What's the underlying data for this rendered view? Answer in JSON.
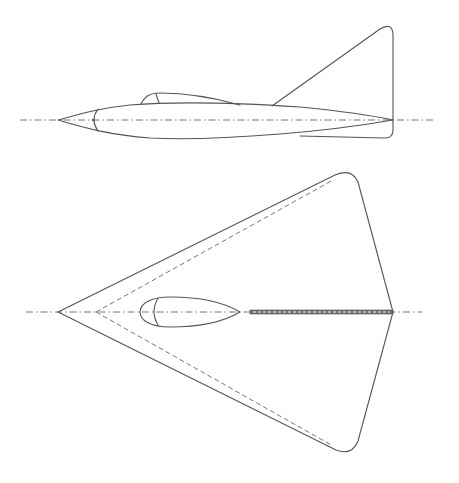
{
  "figure": {
    "type": "aircraft-two-view-drawing",
    "views": [
      {
        "name": "side-view",
        "parts": [
          "fuselage",
          "canopy",
          "vertical-fin",
          "centerline"
        ]
      },
      {
        "name": "plan-view",
        "parts": [
          "delta-wing",
          "hidden-spar-lines",
          "canopy",
          "dorsal-spine",
          "centerline"
        ]
      }
    ],
    "colors": {
      "line": "#555555",
      "background": "#ffffff"
    }
  }
}
